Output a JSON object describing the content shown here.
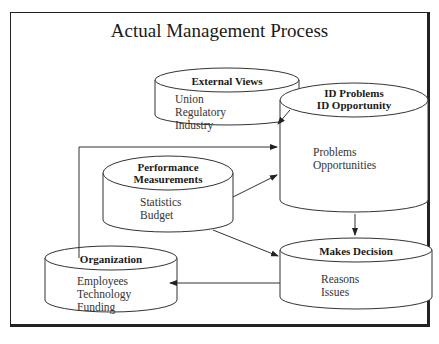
{
  "diagram": {
    "title": "Actual Management Process",
    "nodes": {
      "external_views": {
        "title": "External Views",
        "items": [
          "Union",
          "Regulatory",
          "Industry"
        ]
      },
      "id_problems": {
        "title_line1": "ID Problems",
        "title_line2": "ID Opportunity",
        "items": [
          "Problems",
          "Opportunities"
        ]
      },
      "performance": {
        "title_line1": "Performance",
        "title_line2": "Measurements",
        "items": [
          "Statistics",
          "Budget"
        ]
      },
      "organization": {
        "title": "Organization",
        "items": [
          "Employees",
          "Technology",
          "Funding"
        ]
      },
      "makes_decision": {
        "title": "Makes Decision",
        "items": [
          "Reasons",
          "Issues"
        ]
      }
    },
    "edges": [
      {
        "from": "External Views",
        "to": "ID Problems / ID Opportunity"
      },
      {
        "from": "Organization",
        "to": "ID Problems / ID Opportunity"
      },
      {
        "from": "Performance Measurements",
        "to": "ID Problems / ID Opportunity"
      },
      {
        "from": "Performance Measurements",
        "to": "Makes Decision"
      },
      {
        "from": "ID Problems / ID Opportunity",
        "to": "Makes Decision"
      },
      {
        "from": "Makes Decision",
        "to": "Organization"
      }
    ]
  }
}
